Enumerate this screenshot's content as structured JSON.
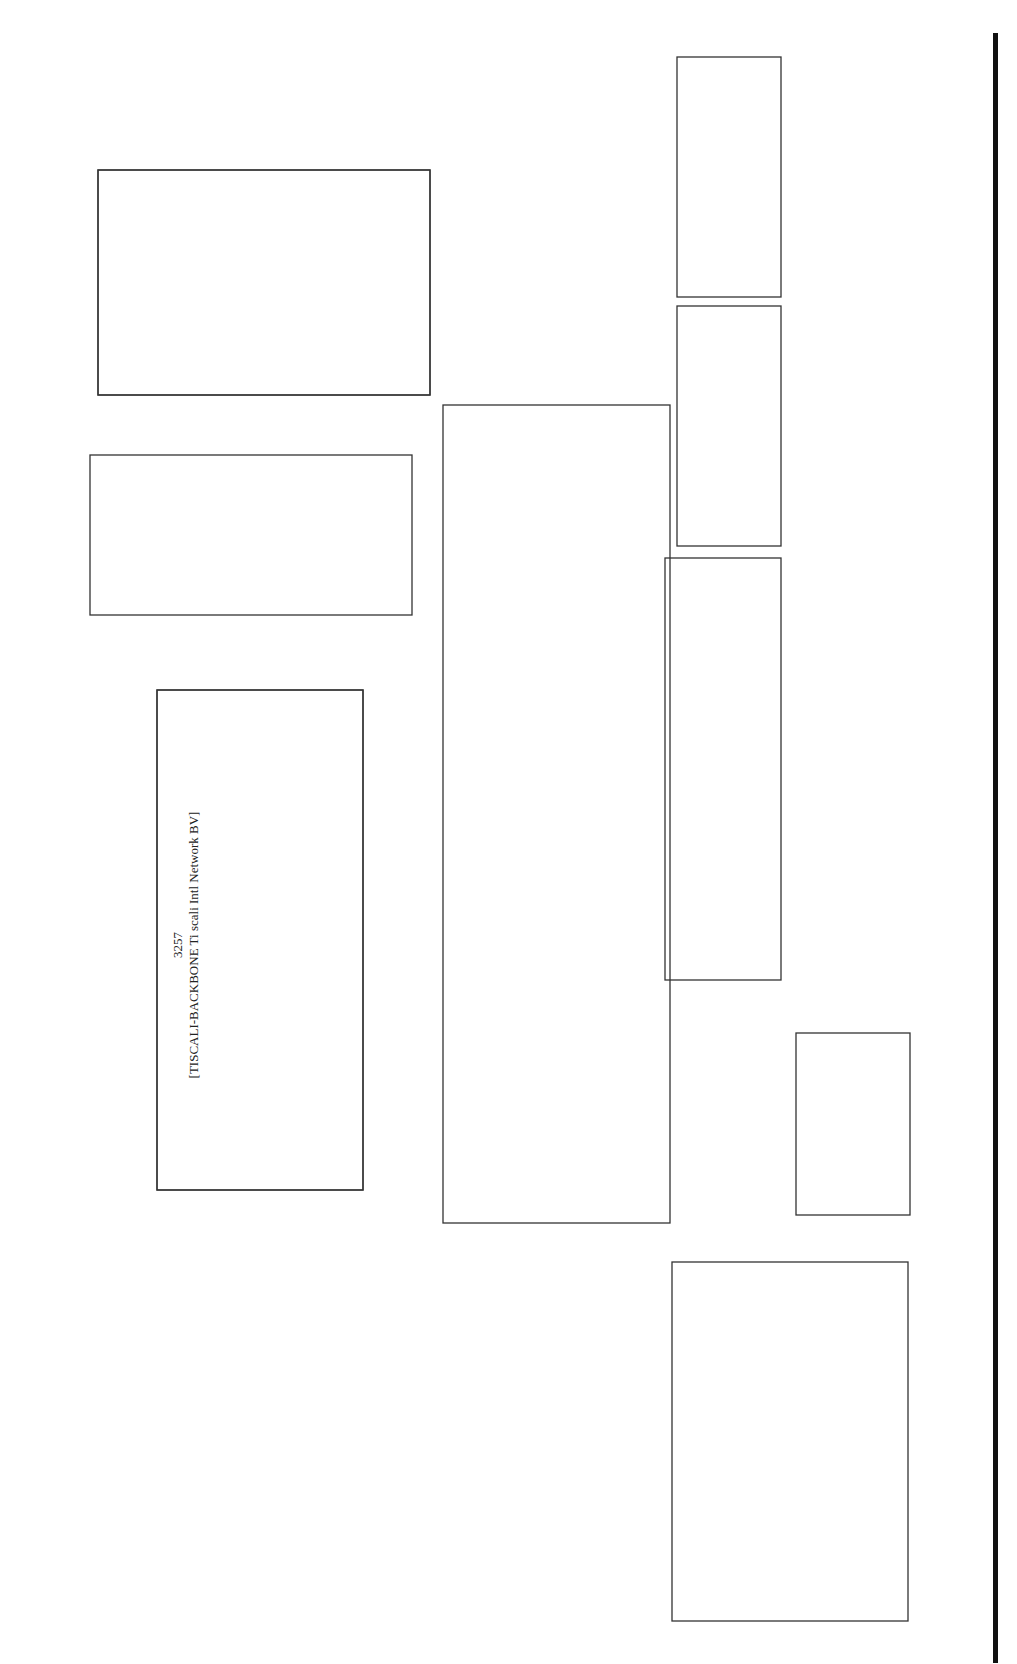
{
  "diagram": {
    "orientation": "rotated-90-ccw",
    "colors": {
      "light": "#c8c8c8",
      "mid": "#8a8a8a",
      "dark": "#3a3a3a",
      "black": "#1c1c1c",
      "record": "#6e6e6e"
    },
    "clusters": [
      {
        "id": "c3257",
        "asn": "3257",
        "name": "[TISCALI-BACKBONE Ti scali Intl Network BV]"
      },
      {
        "id": "c25577",
        "asn": "25577",
        "name": "[C4L-AS C4L main AS]"
      },
      {
        "id": "c24867",
        "asn": "24867",
        "name": "[ADAPT-AS Adapt Services Ltd]"
      },
      {
        "id": "c41173",
        "asn": "41173",
        "name": "[SBT-AS SBT Telecom]"
      },
      {
        "id": "c39848",
        "asn": "39848",
        "name": "[DELTASYS Delta Systems network]"
      },
      {
        "id": "c41731",
        "asn": "41731",
        "name": "[NEVSKCC-AS NEVACON LTD]"
      },
      {
        "id": "c40989",
        "asn": "40989",
        "name": "[RBN-AS RBu Press Network]"
      },
      {
        "id": "c28866",
        "asn": "28866",
        "name": "[AKIMON-AS Aki Mon Telecom]"
      },
      {
        "id": "c20807",
        "asn": "20807",
        "name": "[CREDOLINK-ASN Credolink ISP Autonomous System]"
      }
    ],
    "nodes": {
      "n1": "89.149.186.77",
      "n2": "89.149.186.89",
      "n3": "89.149.186.81",
      "n4": "213.200.79.194",
      "n5": "84.45.24.53",
      "n6": "84.45.90.141",
      "n7": "84.45.47.130",
      "n8": "62.140.208.197",
      "n9": "62.140.208.131",
      "n10": "85.133.4.138",
      "n11": "81.95.156.34",
      "n12": "81.95.156.42",
      "n13": "81.95.156.74",
      "n14": "81.95.156.58",
      "n15": "81.95.156.66",
      "n16": "81.95.156.82",
      "n17": "193.93.232.6 80/tcp",
      "n18": "194.146.204.6 80/tcp",
      "n19": "81.95.155.6 80/tcp",
      "n20a": "81.95.144.6",
      "n20b": "http SA",
      "n21": "81.95.144.94",
      "n22": "81.95.152.6 80/tcp",
      "n23": "80.70.239.253",
      "n24": "81.94.16.6 80/tcp"
    },
    "edges": [
      [
        "89.149.186.77",
        "213.200.79.194"
      ],
      [
        "89.149.186.77",
        "213.200.79.194"
      ],
      [
        "89.149.186.77",
        "213.200.79.194"
      ],
      [
        "89.149.186.81",
        "213.200.79.194"
      ],
      [
        "213.200.79.194",
        "41173"
      ],
      [
        "84.45.24.53",
        "84.45.90.141"
      ],
      [
        "84.45.90.141",
        "84.45.47.130"
      ],
      [
        "84.45.47.130",
        "81.95.156.34"
      ],
      [
        "62.140.208.197",
        "62.140.208.131"
      ],
      [
        "62.140.208.131",
        "85.133.4.138"
      ],
      [
        "85.133.4.138",
        "81.95.156.34"
      ],
      [
        "81.95.156.34",
        "81.95.156.82"
      ],
      [
        "81.95.156.34",
        "81.95.156.66"
      ],
      [
        "81.95.156.34",
        "81.95.156.58"
      ],
      [
        "81.95.156.34",
        "81.95.156.58"
      ],
      [
        "81.95.156.34",
        "81.95.156.74"
      ],
      [
        "81.95.156.34",
        "81.95.156.42"
      ],
      [
        "81.95.156.82",
        "193.93.232.6 80/tcp"
      ],
      [
        "81.95.156.66",
        "194.146.204.6 80/tcp"
      ],
      [
        "81.95.156.58",
        "81.95.144.6 | http SA"
      ],
      [
        "81.95.156.58",
        "81.95.155.6 80/tcp"
      ],
      [
        "81.95.156.74",
        "81.95.144.94"
      ],
      [
        "81.95.144.94",
        "81.95.152.6 80/tcp"
      ],
      [
        "81.95.156.42",
        "80.70.239.253"
      ],
      [
        "80.70.239.253",
        "81.94.16.6 80/tcp"
      ]
    ]
  }
}
